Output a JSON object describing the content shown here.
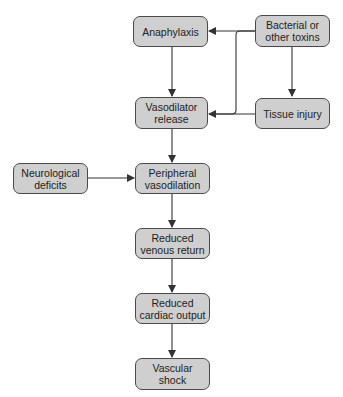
{
  "diagram": {
    "type": "flowchart",
    "nodes": [
      {
        "id": "anaphylaxis",
        "label_lines": [
          "Anaphylaxis"
        ]
      },
      {
        "id": "bacterial",
        "label_lines": [
          "Bacterial or",
          "other toxins"
        ]
      },
      {
        "id": "vasodilator",
        "label_lines": [
          "Vasodilator",
          "release"
        ]
      },
      {
        "id": "tissue",
        "label_lines": [
          "Tissue injury"
        ]
      },
      {
        "id": "neurological",
        "label_lines": [
          "Neurological",
          "deficits"
        ]
      },
      {
        "id": "peripheral",
        "label_lines": [
          "Peripheral",
          "vasodilation"
        ]
      },
      {
        "id": "venous",
        "label_lines": [
          "Reduced",
          "venous return"
        ]
      },
      {
        "id": "cardiac",
        "label_lines": [
          "Reduced",
          "cardiac output"
        ]
      },
      {
        "id": "shock",
        "label_lines": [
          "Vascular",
          "shock"
        ]
      }
    ],
    "edges": [
      {
        "from": "bacterial",
        "to": "anaphylaxis"
      },
      {
        "from": "bacterial",
        "to": "vasodilator"
      },
      {
        "from": "bacterial",
        "to": "tissue"
      },
      {
        "from": "tissue",
        "to": "vasodilator"
      },
      {
        "from": "anaphylaxis",
        "to": "vasodilator"
      },
      {
        "from": "vasodilator",
        "to": "peripheral"
      },
      {
        "from": "neurological",
        "to": "peripheral"
      },
      {
        "from": "peripheral",
        "to": "venous"
      },
      {
        "from": "venous",
        "to": "cardiac"
      },
      {
        "from": "cardiac",
        "to": "shock"
      }
    ],
    "colors": {
      "node_fill": "#cfcfcf",
      "node_border": "#4a4a4a",
      "edge": "#333333"
    }
  }
}
